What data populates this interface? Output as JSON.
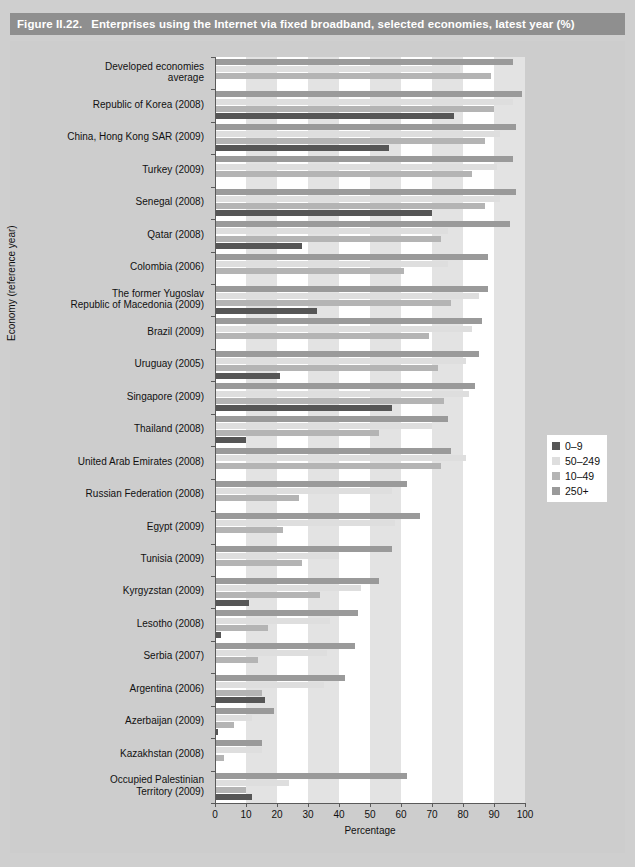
{
  "header": {
    "figure_number": "Figure II.22.",
    "title": "Enterprises using the Internet via fixed broadband, selected economies, latest year (%)"
  },
  "legend": {
    "position": "right-middle",
    "entries": [
      {
        "label": "0–9",
        "color": "#565656"
      },
      {
        "label": "50–249",
        "color": "#dedede"
      },
      {
        "label": "10–49",
        "color": "#b4b4b4"
      },
      {
        "label": "250+",
        "color": "#9a9a9a"
      }
    ]
  },
  "chart_data": {
    "type": "bar",
    "orientation": "horizontal",
    "title": "Enterprises using the Internet via fixed broadband, selected economies, latest year (%)",
    "xlabel": "Percentage",
    "ylabel": "Economy (reference year)",
    "xlim": [
      0,
      100
    ],
    "xticks": [
      0,
      10,
      20,
      30,
      40,
      50,
      60,
      70,
      80,
      90,
      100
    ],
    "grid": "vertical-bands",
    "series_order": [
      "250+",
      "50–249",
      "10–49",
      "0–9"
    ],
    "series_colors": {
      "250+": "#9a9a9a",
      "50–249": "#dedede",
      "10–49": "#b4b4b4",
      "0–9": "#565656"
    },
    "categories": [
      "Developed economies average",
      "Republic of Korea (2008)",
      "China, Hong Kong SAR (2009)",
      "Turkey (2009)",
      "Senegal (2008)",
      "Qatar (2008)",
      "Colombia (2006)",
      "The former Yugoslav Republic of Macedonia (2009)",
      "Brazil (2009)",
      "Uruguay (2005)",
      "Singapore (2009)",
      "Thailand (2008)",
      "United Arab Emirates (2008)",
      "Russian Federation (2008)",
      "Egypt (2009)",
      "Tunisia (2009)",
      "Kyrgyzstan (2009)",
      "Lesotho (2008)",
      "Serbia (2007)",
      "Argentina (2006)",
      "Azerbaijan (2009)",
      "Kazakhstan (2008)",
      "Occupied Palestinian Territory (2009)"
    ],
    "category_lines": [
      [
        "Developed economies",
        "average"
      ],
      [
        "Republic of Korea (2008)"
      ],
      [
        "China, Hong Kong SAR (2009)"
      ],
      [
        "Turkey (2009)"
      ],
      [
        "Senegal (2008)"
      ],
      [
        "Qatar (2008)"
      ],
      [
        "Colombia (2006)"
      ],
      [
        "The former Yugoslav",
        "Republic of Macedonia (2009)"
      ],
      [
        "Brazil (2009)"
      ],
      [
        "Uruguay (2005)"
      ],
      [
        "Singapore (2009)"
      ],
      [
        "Thailand (2008)"
      ],
      [
        "United Arab Emirates (2008)"
      ],
      [
        "Russian Federation (2008)"
      ],
      [
        "Egypt (2009)"
      ],
      [
        "Tunisia (2009)"
      ],
      [
        "Kyrgyzstan (2009)"
      ],
      [
        "Lesotho (2008)"
      ],
      [
        "Serbia (2007)"
      ],
      [
        "Argentina (2006)"
      ],
      [
        "Azerbaijan (2009)"
      ],
      [
        "Kazakhstan (2008)"
      ],
      [
        "Occupied Palestinian",
        "Territory (2009)"
      ]
    ],
    "series": [
      {
        "name": "250+",
        "values": [
          96,
          99,
          97,
          96,
          97,
          95,
          88,
          88,
          86,
          85,
          84,
          75,
          76,
          62,
          66,
          57,
          53,
          46,
          45,
          42,
          19,
          15,
          62
        ]
      },
      {
        "name": "50–249",
        "values": [
          79,
          96,
          92,
          91,
          92,
          75,
          75,
          85,
          83,
          81,
          82,
          70,
          81,
          57,
          58,
          40,
          47,
          37,
          36,
          35,
          12,
          15,
          24
        ]
      },
      {
        "name": "10–49",
        "values": [
          89,
          90,
          87,
          83,
          87,
          73,
          61,
          76,
          69,
          72,
          74,
          53,
          73,
          27,
          22,
          28,
          34,
          17,
          14,
          15,
          6,
          3,
          10
        ]
      },
      {
        "name": "0–9",
        "values": [
          null,
          77,
          56,
          null,
          70,
          28,
          null,
          33,
          null,
          21,
          57,
          10,
          null,
          null,
          null,
          null,
          11,
          2,
          null,
          16,
          1,
          null,
          12
        ]
      }
    ]
  }
}
